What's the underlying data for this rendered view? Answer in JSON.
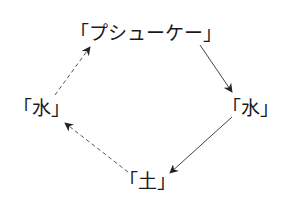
{
  "diagram": {
    "type": "cycle",
    "nodes": [
      {
        "id": "psyche",
        "label": "「プシューケー」"
      },
      {
        "id": "water_right",
        "label": "「水」"
      },
      {
        "id": "earth",
        "label": "「土」"
      },
      {
        "id": "water_left",
        "label": "「水」"
      }
    ],
    "edges": [
      {
        "from": "psyche",
        "to": "water_right",
        "style": "solid"
      },
      {
        "from": "water_right",
        "to": "earth",
        "style": "solid"
      },
      {
        "from": "earth",
        "to": "water_left",
        "style": "dashed"
      },
      {
        "from": "water_left",
        "to": "psyche",
        "style": "dashed"
      }
    ],
    "colors": {
      "text": "#1a1a1a",
      "arrow": "#333333"
    }
  }
}
